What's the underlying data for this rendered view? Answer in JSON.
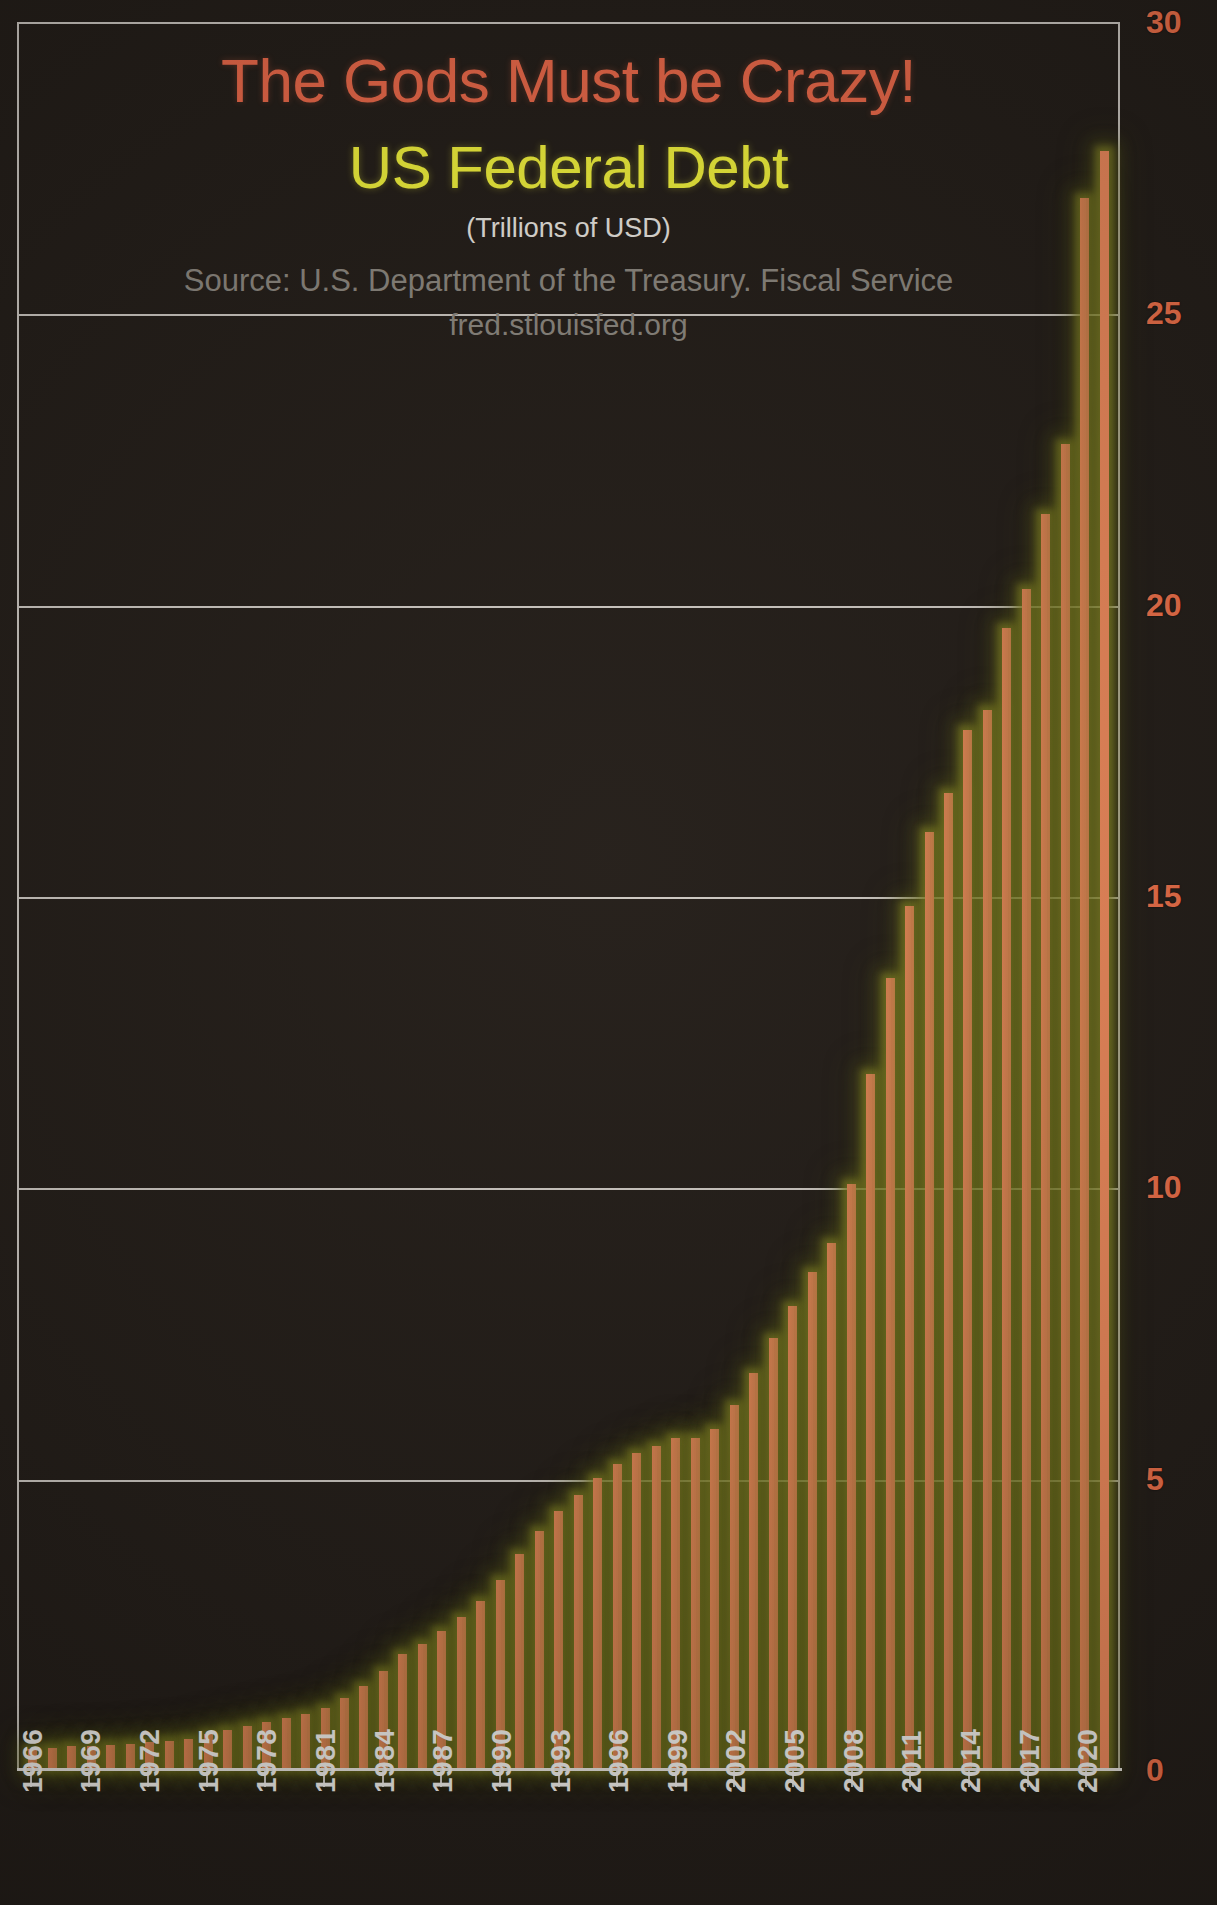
{
  "titles": {
    "headline": "The Gods Must be Crazy!",
    "subject": "US Federal Debt",
    "units": "(Trillions of USD)",
    "source": "Source: U.S. Department of the Treasury. Fiscal Service",
    "url": "fred.stlouisfed.org"
  },
  "colors": {
    "background": "#241e19",
    "bar": "#ef8a5c",
    "bar_glow": "#8a8f28",
    "headline": "#ef6a4a",
    "subject": "#f5f53c",
    "units": "#ece9e3",
    "source": "#8d8880",
    "gridline": "#cfcac4",
    "ytick": "#f0714a",
    "xtick": "#f1efeb"
  },
  "chart_data": {
    "type": "bar",
    "title": "US Federal Debt",
    "subtitle": "The Gods Must be Crazy!",
    "xlabel": "",
    "ylabel": "Trillions of USD",
    "ylim": [
      0,
      30
    ],
    "yticks": [
      0,
      5,
      10,
      15,
      20,
      25,
      30
    ],
    "ytick_labels": [
      "0",
      "5",
      "10",
      "15",
      "20",
      "25",
      "30"
    ],
    "grid": true,
    "legend": false,
    "xtick_labels": [
      "1966",
      "1969",
      "1972",
      "1975",
      "1978",
      "1981",
      "1984",
      "1987",
      "1990",
      "1993",
      "1996",
      "1999",
      "2002",
      "2005",
      "2008",
      "2011",
      "2014",
      "2017",
      "2020"
    ],
    "xtick_step": 3,
    "categories": [
      "1966",
      "1967",
      "1968",
      "1969",
      "1970",
      "1971",
      "1972",
      "1973",
      "1974",
      "1975",
      "1976",
      "1977",
      "1978",
      "1979",
      "1980",
      "1981",
      "1982",
      "1983",
      "1984",
      "1985",
      "1986",
      "1987",
      "1988",
      "1989",
      "1990",
      "1991",
      "1992",
      "1993",
      "1994",
      "1995",
      "1996",
      "1997",
      "1998",
      "1999",
      "2000",
      "2001",
      "2002",
      "2003",
      "2004",
      "2005",
      "2006",
      "2007",
      "2008",
      "2009",
      "2010",
      "2011",
      "2012",
      "2013",
      "2014",
      "2015",
      "2016",
      "2017",
      "2018",
      "2019",
      "2020",
      "2021"
    ],
    "values": [
      0.32,
      0.34,
      0.37,
      0.37,
      0.39,
      0.42,
      0.45,
      0.47,
      0.49,
      0.58,
      0.65,
      0.72,
      0.79,
      0.85,
      0.93,
      1.03,
      1.2,
      1.41,
      1.66,
      1.95,
      2.13,
      2.35,
      2.6,
      2.87,
      3.23,
      3.67,
      4.06,
      4.41,
      4.69,
      4.97,
      5.22,
      5.41,
      5.53,
      5.66,
      5.67,
      5.81,
      6.23,
      6.78,
      7.38,
      7.93,
      8.51,
      9.01,
      10.02,
      11.91,
      13.56,
      14.79,
      16.07,
      16.74,
      17.82,
      18.15,
      19.57,
      20.24,
      21.52,
      22.72,
      26.95,
      27.75
    ]
  }
}
